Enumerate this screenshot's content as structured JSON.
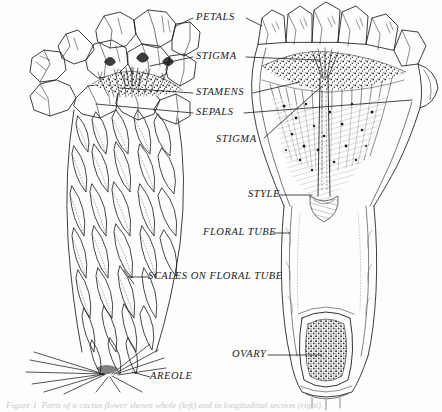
{
  "figure": {
    "ink_color": "#1b1b1b",
    "background_color": "#fdfdfd",
    "caption": "Figure 1. Parts of a cactus flower shown whole (left) and in longitudinal section (right)."
  },
  "labels": [
    {
      "id": "petals",
      "text": "PETALS",
      "x": 196,
      "y": 12
    },
    {
      "id": "stigma-top",
      "text": "STIGMA",
      "x": 196,
      "y": 51
    },
    {
      "id": "stamens",
      "text": "STAMENS",
      "x": 196,
      "y": 87
    },
    {
      "id": "sepals",
      "text": "SEPALS",
      "x": 196,
      "y": 107
    },
    {
      "id": "stigma-lower",
      "text": "STIGMA",
      "x": 216,
      "y": 134
    },
    {
      "id": "style",
      "text": "STYLE",
      "x": 248,
      "y": 189
    },
    {
      "id": "floral-tube",
      "text": "FLORAL TUBE",
      "x": 203,
      "y": 227
    },
    {
      "id": "scales",
      "text": "SCALES ON FLORAL TUBE",
      "x": 148,
      "y": 271
    },
    {
      "id": "areole",
      "text": "AREOLE",
      "x": 150,
      "y": 371
    },
    {
      "id": "ovary",
      "text": "OVARY",
      "x": 232,
      "y": 349
    }
  ],
  "specimens": [
    {
      "id": "whole-flower",
      "name": "Whole cactus flower with scaly floral tube and basal areole",
      "side": "left"
    },
    {
      "id": "section-flower",
      "name": "Longitudinal section of cactus flower showing style and ovary",
      "side": "right"
    }
  ]
}
